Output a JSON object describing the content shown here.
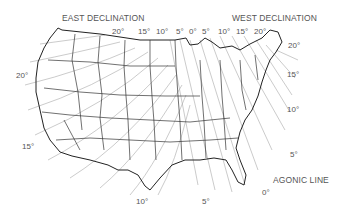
{
  "map": {
    "title_east": "EAST DECLINATION",
    "title_west": "WEST DECLINATION",
    "agonic_label": "AGONIC LINE",
    "colors": {
      "outline": "#222222",
      "isogonic": "#9a9a9a",
      "text": "#555555"
    },
    "top_labels": [
      {
        "text": "20°",
        "x": 112,
        "y": 31
      },
      {
        "text": "15°",
        "x": 138,
        "y": 31
      },
      {
        "text": "10°",
        "x": 156,
        "y": 31
      },
      {
        "text": "5°",
        "x": 176,
        "y": 31
      },
      {
        "text": "0°",
        "x": 189,
        "y": 31
      },
      {
        "text": "5°",
        "x": 202,
        "y": 31
      },
      {
        "text": "10°",
        "x": 218,
        "y": 31
      },
      {
        "text": "15°",
        "x": 236,
        "y": 31
      },
      {
        "text": "20°",
        "x": 254,
        "y": 31
      }
    ],
    "side_labels": [
      {
        "text": "20°",
        "x": 16,
        "y": 73
      },
      {
        "text": "15°",
        "x": 22,
        "y": 144
      },
      {
        "text": "20°",
        "x": 288,
        "y": 43
      },
      {
        "text": "15°",
        "x": 287,
        "y": 72
      },
      {
        "text": "10°",
        "x": 287,
        "y": 107
      },
      {
        "text": "5°",
        "x": 290,
        "y": 152
      },
      {
        "text": "0°",
        "x": 262,
        "y": 190
      },
      {
        "text": "10°",
        "x": 136,
        "y": 199
      },
      {
        "text": "5°",
        "x": 202,
        "y": 199
      }
    ]
  }
}
